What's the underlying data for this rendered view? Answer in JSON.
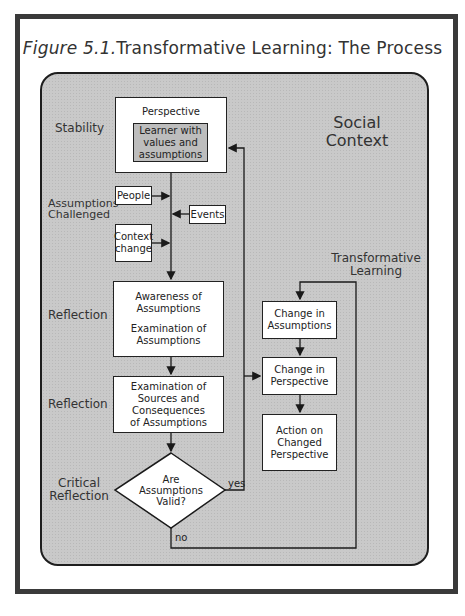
{
  "title": {
    "italic_part": "Figure 5.1.",
    "text": "Transformative Learning: The Process"
  },
  "context_label": [
    "Social",
    "Context"
  ],
  "stage_labels": {
    "stability": "Stability",
    "assumptions_challenged": [
      "Assumptions",
      "Challenged"
    ],
    "reflection_1": "Reflection",
    "reflection_2": "Reflection",
    "critical_reflection": [
      "Critical",
      "Reflection"
    ],
    "transformative_learning": [
      "Transformative",
      "Learning"
    ]
  },
  "boxes": {
    "perspective": {
      "title": "Perspective",
      "inner": [
        "Learner with",
        "values and",
        "assumptions"
      ]
    },
    "people": "People",
    "events": "Events",
    "context_change": [
      "Context",
      "change"
    ],
    "awareness": [
      "Awareness of",
      "Assumptions",
      "",
      "Examination of",
      "Assumptions"
    ],
    "sources": [
      "Examination of",
      "Sources and",
      "Consequences",
      "of Assumptions"
    ],
    "decision": [
      "Are",
      "Assumptions",
      "Valid?"
    ],
    "change_assumptions": [
      "Change in",
      "Assumptions"
    ],
    "change_perspective": [
      "Change in",
      "Perspective"
    ],
    "action": [
      "Action on",
      "Changed",
      "Perspective"
    ]
  },
  "edge_labels": {
    "yes": "yes",
    "no": "no"
  },
  "colors": {
    "panel": "#c9c9c9",
    "frame": "#3a3a3a",
    "box": "#ffffff",
    "shade": "#bdbdbd"
  }
}
